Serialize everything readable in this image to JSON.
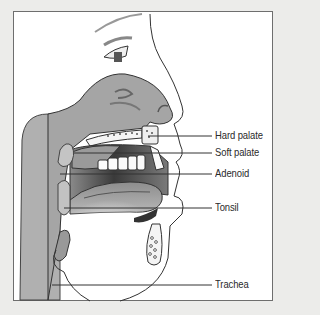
{
  "figure": {
    "type": "anatomical-cross-section",
    "labels": [
      {
        "id": "hard-palate",
        "text": "Hard palate",
        "y": 136
      },
      {
        "id": "soft-palate",
        "text": "Soft palate",
        "y": 153
      },
      {
        "id": "adenoid",
        "text": "Adenoid",
        "y": 174
      },
      {
        "id": "tonsil",
        "text": "Tonsil",
        "y": 208
      },
      {
        "id": "trachea",
        "text": "Trachea",
        "y": 285
      }
    ]
  },
  "colors": {
    "background": "#ececea",
    "frame_border": "#6e6e6e",
    "tissue_grey": "#a9a9a9",
    "dark_cavity": "#4a4a4a",
    "outline": "#333333",
    "label_text": "#2a2a2a"
  }
}
